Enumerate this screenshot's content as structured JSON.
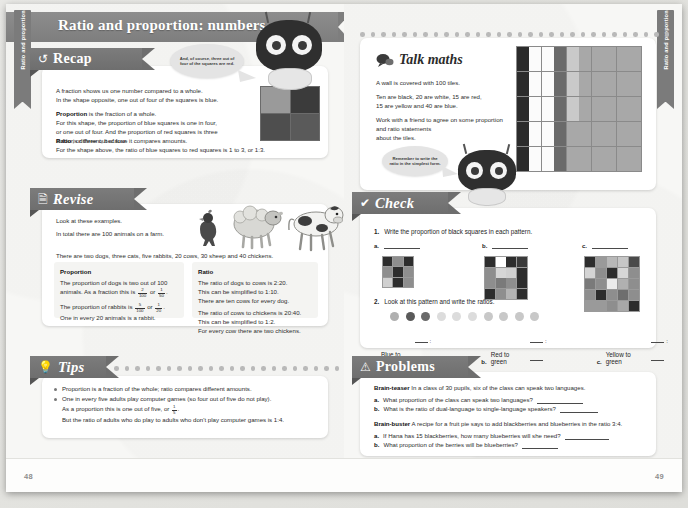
{
  "book": {
    "side_tab_label": "Ratio and proportion",
    "page_title": "Ratio and proportion: numbers",
    "page_left": "48",
    "page_right": "49"
  },
  "recap": {
    "heading": "Recap",
    "icon": "refresh-icon",
    "speech_bubble": "And, of course, three out of four of the squares are red.",
    "p1_line1": "A fraction shows us one number compared to a whole.",
    "p1_line2": "In the shape opposite, one out of four of the squares is blue.",
    "p2_bold": "Proportion",
    "p2_rest": " is the fraction of a whole.",
    "p2_line2": "For this shape, the proportion of blue squares is one in four,",
    "p2_line3": "or one out of four. And the proportion of red squares is three",
    "p2_line4": "in four, or three out of four.",
    "p3_bold": "Ratio",
    "p3_rest": " is different, because it compares amounts.",
    "p3_line2": "For the shape above, the ratio of blue squares to red squares is 1 to 3, or 1:3.",
    "swatch_colors": [
      "#9a9a9a",
      "#3b3b3b",
      "#4e4e4e",
      "#5a5a5a"
    ]
  },
  "revise": {
    "heading": "Revise",
    "icon": "document-icon",
    "intro1": "Look at these examples.",
    "intro2": "In total there are 100 animals on a farm.",
    "intro3": "There are two dogs, three cats, five rabbits, 20 cows, 30 sheep and 40 chickens.",
    "left": {
      "title": "Proportion",
      "l1": "The proportion of dogs is two out of 100",
      "l2a": "animals. As a fraction this is ",
      "f1n": "2",
      "f1d": "100",
      "l2b": " or ",
      "f2n": "1",
      "f2d": "50",
      "l2c": ".",
      "l3a": "The proportion of rabbits is ",
      "f3n": "5",
      "f3d": "100",
      "l3b": " or ",
      "f4n": "1",
      "f4d": "20",
      "l3c": ".",
      "l4": "One in every 20 animals is a rabbit."
    },
    "right": {
      "title": "Ratio",
      "l1": "The ratio of dogs to cows is 2:20.",
      "l2": "This can be simplified to 1:10.",
      "l3": "There are ten cows for every dog.",
      "l4": "The ratio of cows to chickens is 20:40.",
      "l5": "This can be simplified to 1:2.",
      "l6": "For every cow there are two chickens."
    },
    "animals": [
      "chicken",
      "sheep",
      "cow"
    ]
  },
  "tips": {
    "heading": "Tips",
    "icon": "lightbulb-icon",
    "items": [
      {
        "text": "Proportion is a fraction of the whole; ratio compares different amounts."
      }
    ],
    "b2_l1": "One in every five adults play computer games (so four out of five do not play).",
    "b2_l2a": "As a proportion this is one out of five, or ",
    "b2_f_n": "1",
    "b2_f_d": "5",
    "b2_l2b": ".",
    "b2_l3": "But the ratio of adults who do play to adults who don't play computer games is 1:4."
  },
  "talk_maths": {
    "heading": "Talk maths",
    "icon": "speech-bubble-icon",
    "l1": "A wall is covered with 100 tiles.",
    "l2": "Ten are black, 20 are white, 15 are red,",
    "l3": "15 are yellow and 40 are blue.",
    "l4": "Work with a friend to agree on some proportion",
    "l5": "and ratio statements",
    "l6": "about the tiles.",
    "bubble": "Remember to write the ratio in the simplest form.",
    "tile_counts": {
      "black": 10,
      "white": 20,
      "red": 15,
      "yellow": 15,
      "blue": 40
    },
    "tile_colors": {
      "black": "#2b2b2b",
      "white": "#fbfbfb",
      "red": "#6a6a6a",
      "yellow": "#c9c9c9",
      "blue": "#a8a8a8"
    },
    "tile_rows": [
      [
        "black",
        "white",
        "white",
        "red",
        "yellow",
        "blue",
        "blue",
        "blue",
        "blue",
        "blue"
      ],
      [
        "black",
        "white",
        "white",
        "red",
        "yellow",
        "blue",
        "blue",
        "blue",
        "blue",
        "blue"
      ],
      [
        "black",
        "white",
        "white",
        "red",
        "yellow",
        "blue",
        "blue",
        "blue",
        "blue",
        "blue"
      ],
      [
        "black",
        "white",
        "white",
        "red",
        "yellow",
        "blue",
        "blue",
        "blue",
        "blue",
        "blue"
      ],
      [
        "black",
        "white",
        "white",
        "red",
        "yellow",
        "blue",
        "blue",
        "blue",
        "blue",
        "blue"
      ],
      [
        "black",
        "white",
        "white",
        "red",
        "yellow",
        "blue",
        "blue",
        "blue",
        "blue",
        "blue"
      ],
      [
        "black",
        "white",
        "white",
        "red",
        "blue",
        "blue",
        "blue",
        "blue",
        "blue",
        "blue"
      ],
      [
        "black",
        "white",
        "white",
        "red",
        "blue",
        "blue",
        "blue",
        "blue",
        "blue",
        "blue"
      ],
      [
        "black",
        "white",
        "white",
        "red",
        "blue",
        "blue",
        "blue",
        "blue",
        "blue",
        "blue"
      ],
      [
        "black",
        "white",
        "white",
        "red",
        "blue",
        "blue",
        "blue",
        "blue",
        "blue",
        "blue"
      ]
    ]
  },
  "check": {
    "heading": "Check",
    "icon": "tick-icon",
    "q1_num": "1.",
    "q1_text": "Write the proportion of black squares in each pattern.",
    "labels": {
      "a": "a.",
      "b": "b.",
      "c": "c."
    },
    "pattern_a": [
      [
        "#2d2d2d",
        "#8e8e8e",
        "#2d2d2d"
      ],
      [
        "#8e8e8e",
        "#2d2d2d",
        "#8e8e8e"
      ],
      [
        "#d0d0d0",
        "#2d2d2d",
        "#8e8e8e"
      ]
    ],
    "pattern_b": [
      [
        "#2d2d2d",
        "#ffffff",
        "#2d2d2d",
        "#3a3a3a"
      ],
      [
        "#8e8e8e",
        "#d6d6d6",
        "#d0d0d0",
        "#2d2d2d"
      ],
      [
        "#8e8e8e",
        "#7a7a7a",
        "#8e8e8e",
        "#2d2d2d"
      ],
      [
        "#2d2d2d",
        "#8e8e8e",
        "#b4b4b4",
        "#2d2d2d"
      ]
    ],
    "pattern_c": [
      [
        "#2d2d2d",
        "#9a9a9a",
        "#b8b8b8",
        "#c6c6c6",
        "#4a4a4a"
      ],
      [
        "#d4d4d4",
        "#8e8e8e",
        "#2d2d2d",
        "#d6d6d6",
        "#8e8e8e"
      ],
      [
        "#7a7a7a",
        "#8e8e8e",
        "#ececec",
        "#b0b0b0",
        "#8e8e8e"
      ],
      [
        "#8e8e8e",
        "#2d2d2d",
        "#8e8e8e",
        "#6e6e6e",
        "#8e8e8e"
      ],
      [
        "#9a9a9a",
        "#9a9a9a",
        "#8e8e8e",
        "#a8a8a8",
        "#2d2d2d"
      ]
    ],
    "q2_num": "2.",
    "q2_text": "Look at this pattern and write the ratios.",
    "dots": [
      "#b0b0b0",
      "#5a5a5a",
      "#6a6a6a",
      "#dcdcdc",
      "#dcdcdc",
      "#dcdcdc",
      "#c8c8c8",
      "#c8c8c8",
      "#c8c8c8",
      "#c8c8c8"
    ],
    "q2_items": [
      {
        "label": "a.",
        "text": "Blue to red"
      },
      {
        "label": "b.",
        "text": "Red to green"
      },
      {
        "label": "c.",
        "text": "Yellow to green"
      }
    ]
  },
  "problems": {
    "heading": "Problems",
    "icon": "warning-triangle-icon",
    "teaser_bold": "Brain-teaser",
    "teaser_text": " In a class of 30 pupils, six of the class can speak two languages.",
    "teaser_items": [
      {
        "label": "a.",
        "text": "What proportion of the class can speak two languages?"
      },
      {
        "label": "b.",
        "text": "What is the ratio of dual-language to single-language speakers?"
      }
    ],
    "buster_bold": "Brain-buster",
    "buster_text": " A recipe for a fruit pie says to add blackberries and blueberries in the ratio 3:4.",
    "buster_items": [
      {
        "label": "a.",
        "text": "If Hana has 15 blackberries, how many blueberries will she need?"
      },
      {
        "label": "b.",
        "text": "What proportion of the berries will be blueberries?"
      }
    ]
  }
}
